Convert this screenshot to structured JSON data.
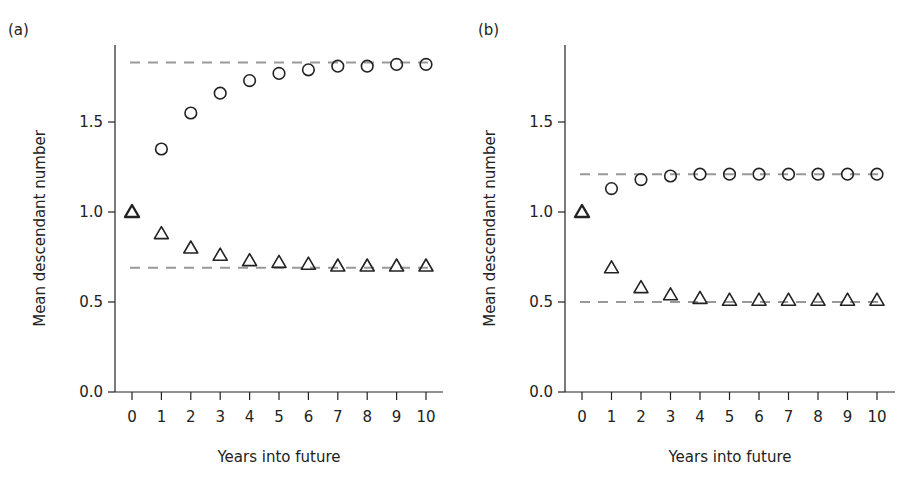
{
  "chart_data": [
    {
      "type": "scatter",
      "panel_label": "(a)",
      "xlabel": "Years into future",
      "ylabel": "Mean descendant number",
      "x": [
        0,
        1,
        2,
        3,
        4,
        5,
        6,
        7,
        8,
        9,
        10
      ],
      "x_tick_labels": [
        "0",
        "1",
        "2",
        "3",
        "4",
        "5",
        "6",
        "7",
        "8",
        "9",
        "10"
      ],
      "y_tick_labels": [
        "0.0",
        "0.5",
        "1.0",
        "1.5"
      ],
      "y_ticks": [
        0.0,
        0.5,
        1.0,
        1.5
      ],
      "ylim": [
        0,
        1.93
      ],
      "grid": false,
      "series": [
        {
          "name": "circles",
          "marker": "circle",
          "values": [
            1.0,
            1.35,
            1.55,
            1.66,
            1.73,
            1.77,
            1.79,
            1.81,
            1.81,
            1.82,
            1.82
          ]
        },
        {
          "name": "triangles",
          "marker": "triangle",
          "values": [
            1.0,
            0.88,
            0.8,
            0.76,
            0.73,
            0.72,
            0.71,
            0.7,
            0.7,
            0.7,
            0.7
          ]
        }
      ],
      "reference_lines": [
        {
          "y": 1.83,
          "style": "dashed",
          "color": "#999999"
        },
        {
          "y": 0.69,
          "style": "dashed",
          "color": "#999999"
        }
      ]
    },
    {
      "type": "scatter",
      "panel_label": "(b)",
      "xlabel": "Years into future",
      "ylabel": "Mean descendant number",
      "x": [
        0,
        1,
        2,
        3,
        4,
        5,
        6,
        7,
        8,
        9,
        10
      ],
      "x_tick_labels": [
        "0",
        "1",
        "2",
        "3",
        "4",
        "5",
        "6",
        "7",
        "8",
        "9",
        "10"
      ],
      "y_tick_labels": [
        "0.0",
        "0.5",
        "1.0",
        "1.5"
      ],
      "y_ticks": [
        0.0,
        0.5,
        1.0,
        1.5
      ],
      "ylim": [
        0,
        1.93
      ],
      "grid": false,
      "series": [
        {
          "name": "circles",
          "marker": "circle",
          "values": [
            1.0,
            1.13,
            1.18,
            1.2,
            1.21,
            1.21,
            1.21,
            1.21,
            1.21,
            1.21,
            1.21
          ]
        },
        {
          "name": "triangles",
          "marker": "triangle",
          "values": [
            1.0,
            0.69,
            0.58,
            0.54,
            0.52,
            0.51,
            0.51,
            0.51,
            0.51,
            0.51,
            0.51
          ]
        }
      ],
      "reference_lines": [
        {
          "y": 1.21,
          "style": "dashed",
          "color": "#999999"
        },
        {
          "y": 0.5,
          "style": "dashed",
          "color": "#999999"
        }
      ]
    }
  ],
  "colors": {
    "axis": "#222222",
    "marker": "#222222",
    "reference_line": "#999999"
  }
}
